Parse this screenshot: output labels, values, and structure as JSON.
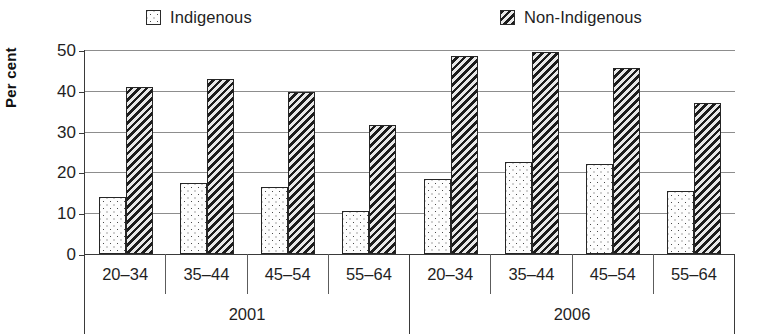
{
  "chart_data": {
    "type": "bar",
    "title": "",
    "xlabel": "",
    "ylabel": "Per cent",
    "ylim": [
      0,
      50
    ],
    "yticks": [
      0,
      10,
      20,
      30,
      40,
      50
    ],
    "ytick_labels": [
      "0",
      "10",
      "20",
      "30",
      "40",
      "50"
    ],
    "grid": true,
    "legend_position": "top",
    "group_labels": [
      "2001",
      "2006"
    ],
    "categories": [
      "20–34",
      "35–44",
      "45–54",
      "55–64"
    ],
    "series": [
      {
        "name": "Indigenous",
        "pattern": "dots",
        "values_2001": [
          14.0,
          17.5,
          16.5,
          10.5
        ],
        "values_2006": [
          18.5,
          22.5,
          22.0,
          15.5
        ]
      },
      {
        "name": "Non-Indigenous",
        "pattern": "diagonal-hatch",
        "values_2001": [
          41.0,
          43.0,
          39.8,
          31.5
        ],
        "values_2006": [
          48.5,
          49.5,
          45.5,
          37.0
        ]
      }
    ],
    "groups": [
      {
        "period": "2001",
        "categories": [
          {
            "label": "20–34",
            "Indigenous": 14.0,
            "Non-Indigenous": 41.0
          },
          {
            "label": "35–44",
            "Indigenous": 17.5,
            "Non-Indigenous": 43.0
          },
          {
            "label": "45–54",
            "Indigenous": 16.5,
            "Non-Indigenous": 39.8
          },
          {
            "label": "55–64",
            "Indigenous": 10.5,
            "Non-Indigenous": 31.5
          }
        ]
      },
      {
        "period": "2006",
        "categories": [
          {
            "label": "20–34",
            "Indigenous": 18.5,
            "Non-Indigenous": 48.5
          },
          {
            "label": "35–44",
            "Indigenous": 22.5,
            "Non-Indigenous": 49.5
          },
          {
            "label": "45–54",
            "Indigenous": 22.0,
            "Non-Indigenous": 45.5
          },
          {
            "label": "55–64",
            "Indigenous": 15.5,
            "Non-Indigenous": 37.0
          }
        ]
      }
    ]
  },
  "legend": {
    "entries": [
      {
        "label": "Indigenous",
        "pattern": "dots"
      },
      {
        "label": "Non-Indigenous",
        "pattern": "diagonal-hatch"
      }
    ]
  },
  "colors": {
    "axis": "#3a3a3a",
    "gridline": "#8d8d8d",
    "text": "#1f1f1f",
    "indigenous_fill": "#fdfdfd",
    "indigenous_dots": "#4a4a4a",
    "nonindigenous_dark": "#1c1c1c",
    "nonindigenous_light": "#e8e8e8"
  }
}
